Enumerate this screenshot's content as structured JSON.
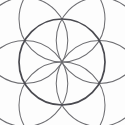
{
  "figure": {
    "name": "seed-of-life-rosette",
    "title": "Six-petal rosette (Seed of Life)",
    "background_color": "#fdfdfd",
    "canvas": {
      "width": 125,
      "height": 125
    }
  },
  "geometry": {
    "center": {
      "x": 62,
      "y": 62
    },
    "outer_radius": 43,
    "petal_circle_radius": 43,
    "petal_count": 6,
    "vertex_angles_deg": [
      270,
      330,
      30,
      90,
      150,
      210
    ],
    "vertices": [
      {
        "label": "top",
        "angle_deg": 270,
        "x": 62,
        "y": 19
      },
      {
        "label": "upper-right",
        "angle_deg": 330,
        "x": 99.24,
        "y": 40.5
      },
      {
        "label": "lower-right",
        "angle_deg": 30,
        "x": 99.24,
        "y": 83.5
      },
      {
        "label": "bottom",
        "angle_deg": 90,
        "x": 62,
        "y": 105
      },
      {
        "label": "lower-left",
        "angle_deg": 150,
        "x": 24.76,
        "y": 83.5
      },
      {
        "label": "upper-left",
        "angle_deg": 210,
        "x": 24.76,
        "y": 40.5
      }
    ]
  },
  "style": {
    "outer_circle_color": "#4a4a50",
    "outer_circle_width": 1.7,
    "petal_circle_color": "#6e6e72",
    "petal_circle_width": 1.05
  }
}
